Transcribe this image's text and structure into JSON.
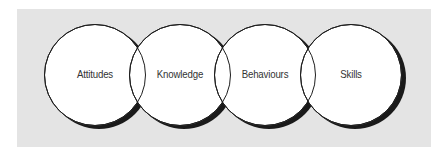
{
  "diagram": {
    "type": "overlapping-circles",
    "colors": {
      "panel": "#e4e4e4",
      "circle_fill": "#ffffff",
      "circle_stroke": "#1e1e1e",
      "shadow": "#1a1a1a",
      "text": "#333333"
    },
    "circles": [
      {
        "label": "Attitudes"
      },
      {
        "label": "Knowledge"
      },
      {
        "label": "Behaviours"
      },
      {
        "label": "Skills"
      }
    ]
  }
}
